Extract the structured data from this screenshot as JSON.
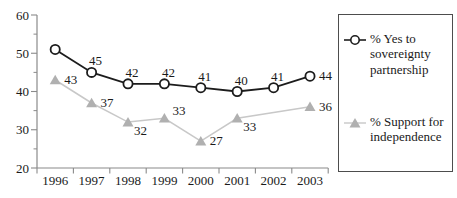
{
  "chart_data": {
    "type": "line",
    "title": "",
    "xlabel": "",
    "ylabel": "",
    "categories": [
      "1996",
      "1997",
      "1998",
      "1999",
      "2000",
      "2001",
      "2002",
      "2003"
    ],
    "series": [
      {
        "name": "% Yes to sovereignty partnership",
        "marker": "open-circle",
        "color": "#1c1c1c",
        "marker_color": "#1c1c1c",
        "values": [
          51,
          45,
          42,
          42,
          41,
          40,
          41,
          44
        ],
        "point_labels": [
          "",
          "45",
          "42",
          "42",
          "41",
          "40",
          "41",
          "44"
        ],
        "label_placement": [
          "none",
          "above",
          "above",
          "above",
          "above",
          "above",
          "above",
          "right"
        ]
      },
      {
        "name": "% Support for independence",
        "marker": "filled-triangle",
        "color": "#c8c8c8",
        "marker_color": "#b0b0b0",
        "values": [
          43,
          37,
          32,
          33,
          27,
          33,
          null,
          36
        ],
        "point_labels": [
          "43",
          "37",
          "32",
          "33",
          "27",
          "33",
          "",
          "36"
        ],
        "label_placement": [
          "right",
          "right",
          "below-right",
          "right-up",
          "right",
          "below-right",
          "none",
          "right"
        ]
      }
    ],
    "ylim": [
      20,
      60
    ],
    "y_major_ticks": [
      20,
      30,
      40,
      50,
      60
    ],
    "y_minor_ticks": [
      25,
      35,
      45,
      55
    ],
    "grid": false,
    "legend": {
      "position": "right",
      "bordered": true
    }
  },
  "colors": {
    "axis": "#8a8a8a",
    "text": "#1a1a1a",
    "background": "#ffffff"
  }
}
